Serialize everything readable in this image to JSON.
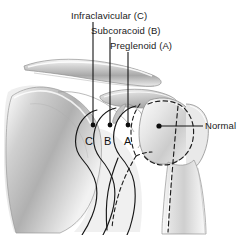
{
  "figure": {
    "background_color": "#ffffff",
    "width": 252,
    "height": 235
  },
  "labels": {
    "infraclavicular": "Infraclavicular (C)",
    "subcoracoid": "Subcoracoid (B)",
    "preglenoid": "Preglenoid (A)",
    "normal": "Normal"
  },
  "markers": {
    "c": "C",
    "b": "B",
    "a": "A"
  },
  "colors": {
    "line": "#1a1a1a",
    "text": "#1a1a1a",
    "bone_light": "#f2f2f2",
    "bone_mid": "#c9c9c9",
    "bone_dark": "#8f8f8f",
    "outline": "#222222"
  },
  "annotations": {
    "leader_dots": 4,
    "dashed_outlines": 2
  }
}
